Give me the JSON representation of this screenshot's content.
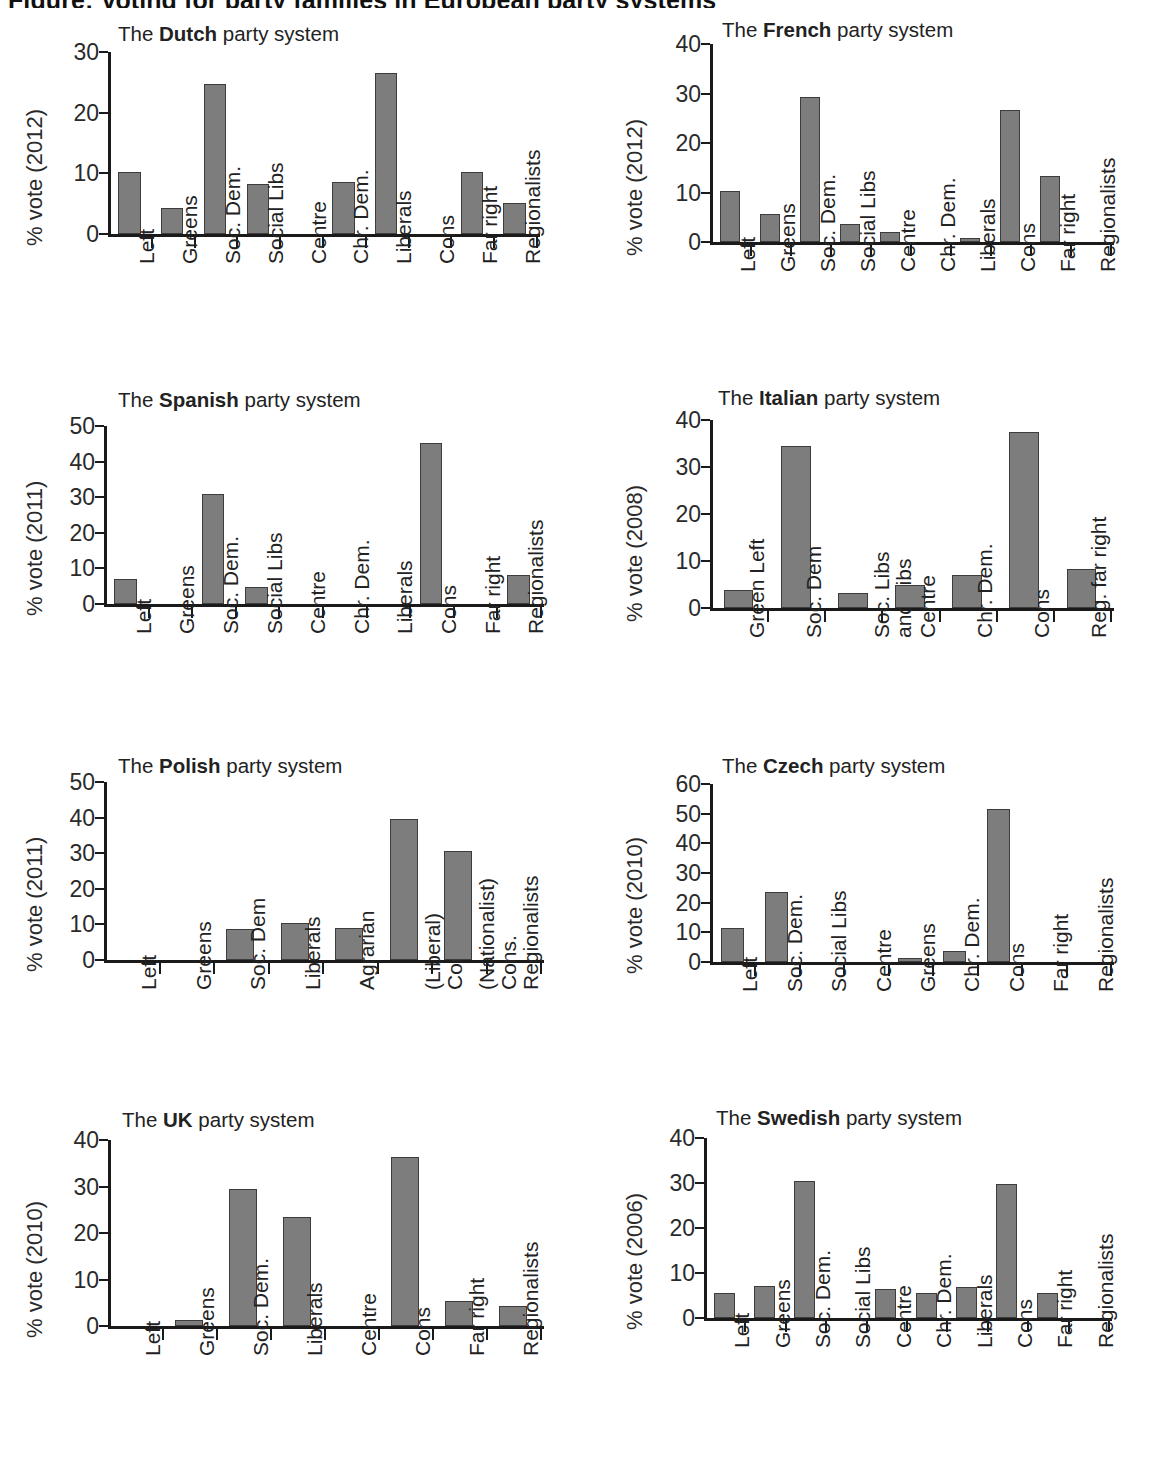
{
  "figure": {
    "heading": "Figure: Voting for party families in European party systems"
  },
  "chart_data": [
    {
      "id": "dutch",
      "type": "bar",
      "title_prefix": "The ",
      "title_country": "Dutch",
      "title_suffix": " party system",
      "ylabel": "% vote (2012)",
      "xlabel": "",
      "ylim": [
        0,
        30
      ],
      "yticks": [
        0,
        10,
        20,
        30
      ],
      "grid": false,
      "categories": [
        "Left",
        "Greens",
        "Soc. Dem.",
        "Social Libs",
        "Centre",
        "Chr. Dem.",
        "Liberals",
        "Cons",
        "Far right",
        "Regionalists"
      ],
      "values": [
        10.2,
        4.3,
        24.7,
        8.2,
        0,
        8.6,
        26.6,
        0,
        10.2,
        5.1
      ]
    },
    {
      "id": "french",
      "type": "bar",
      "title_prefix": "The ",
      "title_country": "French",
      "title_suffix": " party system",
      "ylabel": "% vote (2012)",
      "xlabel": "",
      "ylim": [
        0,
        40
      ],
      "yticks": [
        0,
        10,
        20,
        30,
        40
      ],
      "grid": false,
      "categories": [
        "Left",
        "Greens",
        "Soc. Dem.",
        "Social Libs",
        "Centre",
        "Chr. Dem.",
        "Liberals",
        "Cons",
        "Far right",
        "Regionalists"
      ],
      "values": [
        10.3,
        5.7,
        29.3,
        3.6,
        2.1,
        0,
        0.8,
        26.7,
        13.3,
        0
      ]
    },
    {
      "id": "spanish",
      "type": "bar",
      "title_prefix": "The ",
      "title_country": "Spanish",
      "title_suffix": " party system",
      "ylabel": "% vote (2011)",
      "xlabel": "",
      "ylim": [
        0,
        50
      ],
      "yticks": [
        0,
        10,
        20,
        30,
        40,
        50
      ],
      "grid": false,
      "categories": [
        "Left",
        "Greens",
        "Soc. Dem.",
        "Social Libs",
        "Centre",
        "Chr. Dem.",
        "Liberals",
        "Cons",
        "Far right",
        "Regionalists"
      ],
      "values": [
        6.9,
        0,
        31.0,
        4.8,
        0,
        0,
        0,
        45.3,
        0,
        8.2
      ]
    },
    {
      "id": "italian",
      "type": "bar",
      "title_prefix": "The ",
      "title_country": "Italian",
      "title_suffix": " party system",
      "ylabel": "% vote (2008)",
      "xlabel": "",
      "ylim": [
        0,
        40
      ],
      "yticks": [
        0,
        10,
        20,
        30,
        40
      ],
      "grid": false,
      "categories": [
        "Green Left",
        "Soc. Dem",
        "Soc. Libs\nand Libs",
        "Centre",
        "Chr. Dem.",
        "Cons",
        "Reg. far right"
      ],
      "values": [
        3.9,
        34.5,
        3.2,
        4.9,
        7.1,
        37.4,
        8.2
      ]
    },
    {
      "id": "polish",
      "type": "bar",
      "title_prefix": "The ",
      "title_country": "Polish",
      "title_suffix": " party system",
      "ylabel": "% vote (2011)",
      "xlabel": "",
      "ylim": [
        0,
        50
      ],
      "yticks": [
        0,
        10,
        20,
        30,
        40,
        50
      ],
      "grid": false,
      "categories": [
        "Left",
        "Greens",
        "Soc. Dem",
        "Liberals",
        "Agrarian",
        "(Liberal)\nCons.",
        "(Nationalist)\nCons.",
        "Regionalists"
      ],
      "values": [
        0,
        0,
        8.8,
        10.4,
        8.9,
        39.6,
        30.5,
        0
      ]
    },
    {
      "id": "czech",
      "type": "bar",
      "title_prefix": "The ",
      "title_country": "Czech",
      "title_suffix": " party system",
      "ylabel": "% vote (2010)",
      "xlabel": "",
      "ylim": [
        0,
        60
      ],
      "yticks": [
        0,
        10,
        20,
        30,
        40,
        50,
        60
      ],
      "grid": false,
      "categories": [
        "Left",
        "Soc. Dem.",
        "Social Libs",
        "Centre",
        "Greens",
        "Chr. Dem.",
        "Cons",
        "Far right",
        "Regionalists"
      ],
      "values": [
        11.3,
        23.6,
        0,
        0,
        1.5,
        3.6,
        51.5,
        0,
        0
      ]
    },
    {
      "id": "uk",
      "type": "bar",
      "title_prefix": "The ",
      "title_country": "UK",
      "title_suffix": " party system",
      "ylabel": "% vote (2010)",
      "xlabel": "",
      "ylim": [
        0,
        40
      ],
      "yticks": [
        0,
        10,
        20,
        30,
        40
      ],
      "grid": false,
      "categories": [
        "Left",
        "Greens",
        "Soc. Dem.",
        "Liberals",
        "Centre",
        "Cons",
        "Far right",
        "Regionalists"
      ],
      "values": [
        0,
        1.2,
        29.4,
        23.4,
        0,
        36.3,
        5.3,
        4.3
      ]
    },
    {
      "id": "swedish",
      "type": "bar",
      "title_prefix": "The ",
      "title_country": "Swedish",
      "title_suffix": " party system",
      "ylabel": "% vote (2006)",
      "xlabel": "",
      "ylim": [
        0,
        40
      ],
      "yticks": [
        0,
        10,
        20,
        30,
        40
      ],
      "grid": false,
      "categories": [
        "Left",
        "Greens",
        "Soc. Dem.",
        "Social Libs",
        "Centre",
        "Chr. Dem.",
        "Liberals",
        "Cons",
        "Far right",
        "Regionalists"
      ],
      "values": [
        5.6,
        7.2,
        30.5,
        0,
        6.4,
        5.5,
        6.9,
        29.8,
        5.5,
        0
      ]
    }
  ],
  "style": {
    "bar_fill": "#7d7d7d",
    "bar_stroke": "#3c3c3c",
    "axis_color": "#1a1a1a",
    "text_color": "#222222",
    "background": "#ffffff"
  }
}
